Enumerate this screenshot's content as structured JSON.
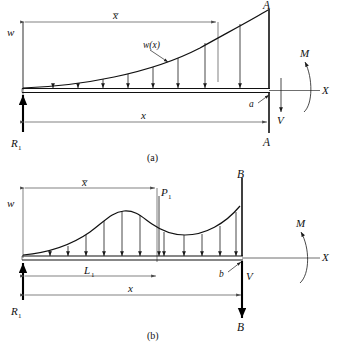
{
  "figure": {
    "panels": [
      {
        "caption": "(a)",
        "labels": {
          "w": "w",
          "w_of_x": "w(x)",
          "x_bar": "x̅",
          "x": "x",
          "reaction": "R",
          "reaction_sub": "1",
          "section_top": "A",
          "section_bottom": "A",
          "cut_point": "a",
          "shear": "V",
          "moment": "M",
          "axis": "X"
        },
        "load_shape": "exponential-increasing",
        "load_arrow_count": 8,
        "point_load": null
      },
      {
        "caption": "(b)",
        "labels": {
          "w": "w",
          "x_bar": "x̅",
          "L1": "L",
          "L1_sub": "1",
          "x": "x",
          "reaction": "R",
          "reaction_sub": "1",
          "section_top": "B",
          "section_bottom": "B",
          "cut_point": "b",
          "shear": "V",
          "moment": "M",
          "axis": "X",
          "point_load": "P",
          "point_load_sub": "1"
        },
        "load_shape": "wavy-hump-then-valley",
        "load_arrow_count": 11,
        "point_load": "P1"
      }
    ],
    "colors": {
      "ink": "#111111",
      "thin_rule": "#4a4a4a",
      "background": "#ffffff"
    }
  }
}
